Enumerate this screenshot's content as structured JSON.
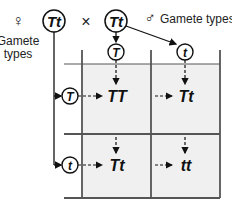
{
  "female": {
    "symbol": "♀",
    "genotype": "Tt",
    "label_line1": "Gamete",
    "label_line2": "types",
    "gametes": [
      "T",
      "t"
    ]
  },
  "cross_symbol": "×",
  "male": {
    "symbol": "♂",
    "genotype": "Tt",
    "label": "Gamete types",
    "gametes": [
      "T",
      "t"
    ]
  },
  "grid": {
    "cells": [
      [
        "TT",
        "Tt"
      ],
      [
        "Tt",
        "tt"
      ]
    ],
    "cell_fill": "#f0f0f0",
    "line_color": "#555555"
  }
}
